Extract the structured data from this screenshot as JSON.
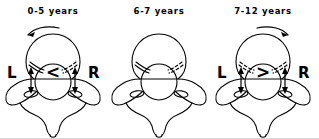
{
  "figure": {
    "type": "medical-illustration",
    "background_color": "#ffffff",
    "line_color": "#000000",
    "panel_count": 3
  },
  "panels": [
    {
      "title": "0-5 years",
      "left_label": "L",
      "right_label": "R",
      "asymmetry_symbol": "<",
      "rotation_arrow": "counterclockwise",
      "has_pedicle_arrows": true,
      "has_rotation_arrow": true,
      "has_side_labels": true
    },
    {
      "title": "6-7 years",
      "left_label": "",
      "right_label": "",
      "asymmetry_symbol": "",
      "rotation_arrow": "none",
      "has_pedicle_arrows": false,
      "has_rotation_arrow": false,
      "has_side_labels": false
    },
    {
      "title": "7-12 years",
      "left_label": "L",
      "right_label": "R",
      "asymmetry_symbol": ">",
      "rotation_arrow": "clockwise",
      "has_pedicle_arrows": true,
      "has_rotation_arrow": true,
      "has_side_labels": true
    }
  ]
}
